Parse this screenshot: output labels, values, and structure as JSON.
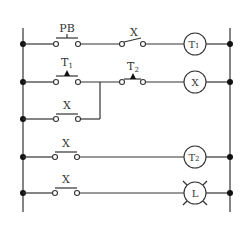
{
  "diagram": {
    "type": "ladder-logic",
    "rungs": [
      {
        "id": "rung-1",
        "contacts": [
          {
            "label": "PB",
            "kind": "pushbutton-normally-open"
          },
          {
            "label": "X",
            "kind": "normally-open"
          }
        ],
        "output": {
          "label": "T1",
          "kind": "timer-coil"
        }
      },
      {
        "id": "rung-2",
        "contacts": [
          {
            "label": "T1",
            "kind": "timed-normally-open"
          },
          {
            "label": "T2",
            "kind": "timed-normally-open"
          }
        ],
        "branch": {
          "label": "X",
          "kind": "normally-open",
          "parallel_to": "T1"
        },
        "output": {
          "label": "X",
          "kind": "relay-coil"
        }
      },
      {
        "id": "rung-4",
        "contacts": [
          {
            "label": "X",
            "kind": "normally-open"
          }
        ],
        "output": {
          "label": "T2",
          "kind": "timer-coil"
        }
      },
      {
        "id": "rung-5",
        "contacts": [
          {
            "label": "X",
            "kind": "normally-open"
          }
        ],
        "output": {
          "label": "L",
          "kind": "lamp"
        }
      }
    ],
    "labels": {
      "pb": "PB",
      "x": "X",
      "t1_main": "T",
      "t1_sub": "1",
      "t2_main": "T",
      "t2_sub": "2",
      "l": "L"
    }
  }
}
